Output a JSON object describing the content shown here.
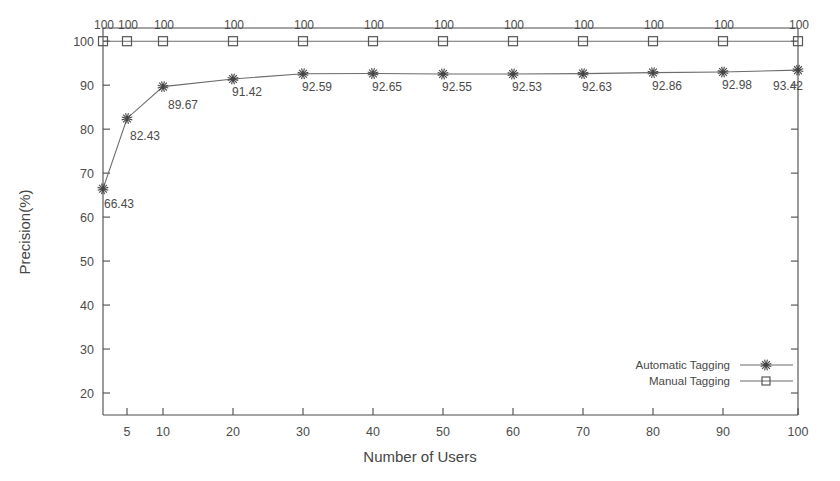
{
  "chart_data": {
    "type": "line",
    "title": "",
    "subtitle": "",
    "xlabel": "Number of Users",
    "ylabel": "Precision(%)",
    "categories": [
      "5",
      "10",
      "20",
      "30",
      "40",
      "50",
      "60",
      "70",
      "80",
      "90",
      "100"
    ],
    "x_tick_labels": [
      "5",
      "10",
      "20",
      "30",
      "40",
      "50",
      "60",
      "70",
      "80",
      "90",
      "100"
    ],
    "y_tick_labels": [
      "20",
      "30",
      "40",
      "50",
      "60",
      "70",
      "80",
      "90",
      "100"
    ],
    "ylim": [
      15,
      103
    ],
    "grid": false,
    "legend_position": "bottom-right",
    "series": [
      {
        "name": "Automatic Tagging",
        "marker": "star",
        "x": [
          3,
          5,
          10,
          20,
          30,
          40,
          50,
          60,
          70,
          80,
          90,
          100
        ],
        "values": [
          66.43,
          82.43,
          89.67,
          91.42,
          92.59,
          92.65,
          92.55,
          92.53,
          92.63,
          92.86,
          92.98,
          93.42
        ],
        "point_labels": [
          "66.43",
          "82.43",
          "89.67",
          "91.42",
          "92.59",
          "92.65",
          "92.55",
          "92.53",
          "92.63",
          "92.86",
          "92.98",
          "93.42"
        ]
      },
      {
        "name": "Manual Tagging",
        "marker": "square",
        "x": [
          3,
          5,
          10,
          20,
          30,
          40,
          50,
          60,
          70,
          80,
          90,
          100
        ],
        "values": [
          100,
          100,
          100,
          100,
          100,
          100,
          100,
          100,
          100,
          100,
          100,
          100
        ],
        "point_labels": [
          "100",
          "100",
          "100",
          "100",
          "100",
          "100",
          "100",
          "100",
          "100",
          "100",
          "100",
          "100"
        ]
      }
    ],
    "colors": {
      "axis": "#4a4a4a",
      "automatic_tagging": "#6b6b6b",
      "manual_tagging": "#6b6b6b",
      "background": "#ffffff",
      "text": "#4b4b4b"
    }
  },
  "legend": {
    "entries": [
      {
        "label": "Automatic Tagging"
      },
      {
        "label": "Manual Tagging"
      }
    ]
  }
}
